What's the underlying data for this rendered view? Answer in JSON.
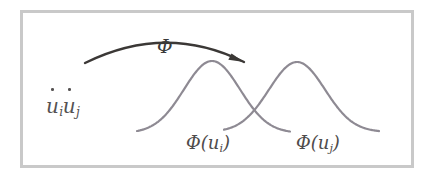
{
  "figure": {
    "width": 434,
    "height": 182,
    "background_color": "#ffffff",
    "frame": {
      "name": "figure-border",
      "x": 20,
      "y": 10,
      "width": 394,
      "height": 158,
      "color": "#c9c9c9",
      "stroke_width": 3
    }
  },
  "labels": {
    "domain_points": {
      "text": "u̇i u̇j",
      "u_i": "u",
      "sub_i": "i",
      "u_j": "u",
      "sub_j": "j",
      "color": "#555252",
      "x": 46,
      "y": 96
    },
    "map_symbol": {
      "text": "Φ",
      "color": "#3a3a3a",
      "x": 157,
      "y": 37
    },
    "image_point_i": {
      "text": "Φ(u",
      "sub": "i",
      "close": ")",
      "full": "Φ(ui)",
      "color": "#4f4c4c",
      "x": 186,
      "y": 134
    },
    "image_point_j": {
      "text": "Φ(u",
      "sub": "j",
      "close": ")",
      "full": "Φ(uj)",
      "color": "#4f4c4c",
      "x": 296,
      "y": 134
    }
  },
  "arrow": {
    "name": "phi-mapping-arrow",
    "color": "#3b3836",
    "stroke_width": 2.4,
    "start": [
      85,
      63
    ],
    "control": [
      166,
      23
    ],
    "end": [
      244,
      62
    ],
    "head_angle_deg": 52
  },
  "chart_data": {
    "type": "line",
    "title": "",
    "xlabel": "",
    "ylabel": "",
    "grid": false,
    "legend": null,
    "axis_visible": false,
    "curve_color": "#8e8a93",
    "curve_stroke_width": 2.2,
    "baseline_y": 133,
    "xlim": [
      136,
      380
    ],
    "series": [
      {
        "name": "Φ(ui)",
        "shape": "gaussian",
        "peak_x": 212,
        "peak_y": 61,
        "baseline_y": 133,
        "left_tail_x": 137,
        "right_tail_x": 290,
        "amplitude": 72,
        "sigma": 28
      },
      {
        "name": "Φ(uj)",
        "shape": "gaussian",
        "peak_x": 297,
        "peak_y": 62,
        "baseline_y": 132,
        "left_tail_x": 224,
        "right_tail_x": 379,
        "amplitude": 70,
        "sigma": 28
      }
    ],
    "crossing_point": [
      255,
      125
    ]
  }
}
